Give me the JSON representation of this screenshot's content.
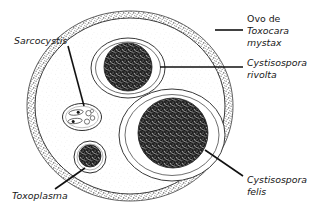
{
  "figure": {
    "background_color": "#ffffff",
    "ink_color": "#171717"
  },
  "labels": [
    {
      "id": "toxocara",
      "name": "label-ovo-de-toxocara-mystax",
      "lines": [
        "Ovo de",
        "Toxocara",
        "mystax"
      ],
      "line1": "Ovo de",
      "line2": "Toxocara",
      "line3": "mystax",
      "italic_lines": [
        false,
        true,
        true
      ],
      "x": 247,
      "y": 22,
      "leader": "horizontal-short"
    },
    {
      "id": "rivolta",
      "name": "label-cystisospora-rivolta",
      "lines": [
        "Cystisospora",
        "rivolta"
      ],
      "line1": "Cystisospora",
      "line2": "rivolta",
      "italic_lines": [
        true,
        true
      ],
      "x": 247,
      "y": 63,
      "leader": "horizontal-long"
    },
    {
      "id": "felis",
      "name": "label-cystisospora-felis",
      "lines": [
        "Cystisospora",
        "felis"
      ],
      "line1": "Cystisospora",
      "line2": "felis",
      "italic_lines": [
        true,
        true
      ],
      "x": 247,
      "y": 183,
      "leader": "diagonal-down-right"
    },
    {
      "id": "sarcocystis",
      "name": "label-sarcocystis",
      "lines": [
        "Sarcocystis"
      ],
      "line1": "Sarcocystis",
      "italic_lines": [
        true
      ],
      "x": 14,
      "y": 41,
      "leader": "diagonal-down-right"
    },
    {
      "id": "toxoplasma",
      "name": "label-toxoplasma",
      "lines": [
        "Toxoplasma"
      ],
      "line1": "Toxoplasma",
      "italic_lines": [
        true
      ],
      "x": 12,
      "y": 198,
      "leader": "diagonal-up-right"
    }
  ],
  "structures": [
    {
      "id": "egg-shell",
      "name": "toxocara-egg-shell",
      "description": "Ovo de Toxocara mystax - casca externa mamilonada",
      "shape": "oval",
      "cx": 130,
      "cy": 106,
      "rx": 103,
      "ry": 95,
      "wall": "stippled-pitted"
    },
    {
      "id": "rivolta-oocyst",
      "name": "cystisospora-rivolta-oocyst",
      "description": "Oocisto de Cystisospora rivolta",
      "shape": "oval",
      "cx": 128,
      "cy": 68,
      "rx": 36,
      "ry": 29,
      "wall": "double",
      "sporont": {
        "cx": 128,
        "cy": 67,
        "r": 24,
        "fill": "stipple-dark"
      }
    },
    {
      "id": "felis-oocyst",
      "name": "cystisospora-felis-oocyst",
      "description": "Oocisto de Cystisospora felis",
      "shape": "oval",
      "cx": 172,
      "cy": 135,
      "rx": 52,
      "ry": 45,
      "wall": "double",
      "sporont": {
        "cx": 173,
        "cy": 133,
        "r": 35,
        "fill": "stipple-dark"
      }
    },
    {
      "id": "sarcocystis-sporocyst",
      "name": "sarcocystis-sporocyst",
      "description": "Esporocisto de Sarcocystis com esporozoitos",
      "shape": "oval",
      "cx": 82,
      "cy": 117,
      "rx": 19,
      "ry": 13,
      "wall": "single",
      "internal_bodies": 6
    },
    {
      "id": "toxoplasma-oocyst",
      "name": "toxoplasma-oocyst",
      "description": "Oocisto de Toxoplasma",
      "shape": "circle",
      "cx": 90,
      "cy": 157,
      "r": 16,
      "wall": "thin-double",
      "sporont": {
        "cx": 90,
        "cy": 156,
        "r": 11,
        "fill": "stipple-dark"
      }
    }
  ]
}
